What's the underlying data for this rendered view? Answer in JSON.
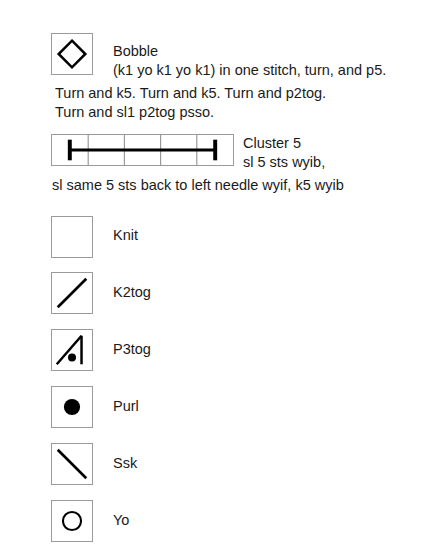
{
  "document": {
    "type": "knitting-chart-legend",
    "background_color": "#ffffff",
    "symbol_color": "#000000",
    "box_border_color": "#9a9a9a"
  },
  "entries": {
    "bobble": {
      "icon": "diamond-outline-icon",
      "name": "Bobble",
      "description_line1": "(k1 yo k1 yo k1) in one stitch, turn, and p5.",
      "description_line2": "Turn and k5. Turn and k5. Turn and p2tog.",
      "description_line3": "Turn and sl1 p2tog psso."
    },
    "cluster5": {
      "icon": "cluster-five-ibeam-icon",
      "cells": 5,
      "name": "Cluster 5",
      "description_line1": "sl 5 sts wyib,",
      "description_line2": "sl same 5 sts back to left needle wyif, k5 wyib"
    },
    "knit": {
      "icon": "empty-square-icon",
      "name": "Knit"
    },
    "k2tog": {
      "icon": "forward-slash-icon",
      "name": "K2tog"
    },
    "p3tog": {
      "icon": "diagonal-vertical-dot-icon",
      "name": "P3tog"
    },
    "purl": {
      "icon": "filled-circle-icon",
      "name": "Purl"
    },
    "ssk": {
      "icon": "back-slash-icon",
      "name": "Ssk"
    },
    "yo": {
      "icon": "open-circle-icon",
      "name": "Yo"
    }
  }
}
